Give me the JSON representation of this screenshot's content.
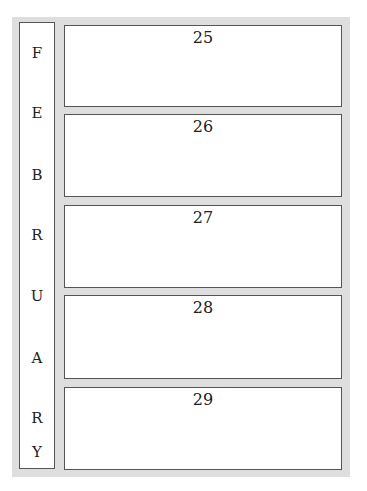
{
  "month": {
    "name": "FEBRUARY",
    "letters": [
      "F",
      "E",
      "B",
      "R",
      "U",
      "A",
      "R",
      "Y"
    ]
  },
  "days": [
    {
      "label": "25"
    },
    {
      "label": "26"
    },
    {
      "label": "27"
    },
    {
      "label": "28"
    },
    {
      "label": "29"
    }
  ],
  "colors": {
    "frame": "#dedede",
    "border": "#555555",
    "background": "#ffffff"
  }
}
